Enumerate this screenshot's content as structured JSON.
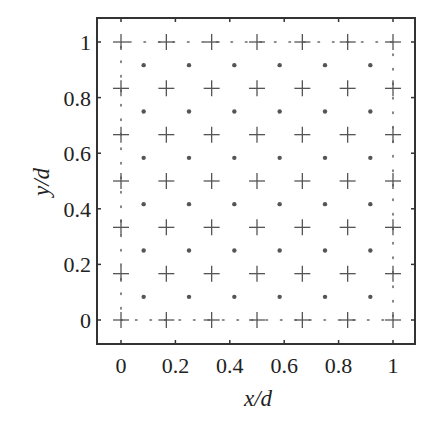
{
  "chart_data": {
    "type": "scatter",
    "title": "",
    "xlabel": "x/d",
    "ylabel": "y/d",
    "xlim": [
      -0.09,
      1.08
    ],
    "ylim": [
      -0.09,
      1.09
    ],
    "xticks": [
      0,
      0.2,
      0.4,
      0.6,
      0.8,
      1
    ],
    "yticks": [
      0,
      0.2,
      0.4,
      0.6,
      0.8,
      1
    ],
    "xtick_labels": [
      "0",
      "0.2",
      "0.4",
      "0.6",
      "0.8",
      "1"
    ],
    "ytick_labels": [
      "0",
      "0.2",
      "0.4",
      "0.6",
      "0.8",
      "1"
    ],
    "grid": false,
    "legend": null,
    "series": [
      {
        "name": "cross-nodes",
        "marker": "+",
        "color": "#555555",
        "x_values": [
          0,
          0.1667,
          0.3333,
          0.5,
          0.6667,
          0.8333,
          1
        ],
        "y_values": [
          0,
          0.1667,
          0.3333,
          0.5,
          0.6667,
          0.8333,
          1
        ],
        "layout": "7x7 grid of all x/y combinations"
      },
      {
        "name": "dot-nodes",
        "marker": "•",
        "color": "#555555",
        "x_values": [
          0.0833,
          0.25,
          0.4167,
          0.5833,
          0.75,
          0.9167
        ],
        "y_values": [
          0.0833,
          0.25,
          0.4167,
          0.5833,
          0.75,
          0.9167
        ],
        "layout": "6x6 grid of all x/y combinations"
      },
      {
        "name": "boundary",
        "style": "dotted",
        "color": "#666666",
        "path": [
          [
            0,
            0
          ],
          [
            1,
            0
          ],
          [
            1,
            1
          ],
          [
            0,
            1
          ],
          [
            0,
            0
          ]
        ]
      }
    ]
  },
  "axes": {
    "x_label": "x/d",
    "y_label": "y/d"
  }
}
